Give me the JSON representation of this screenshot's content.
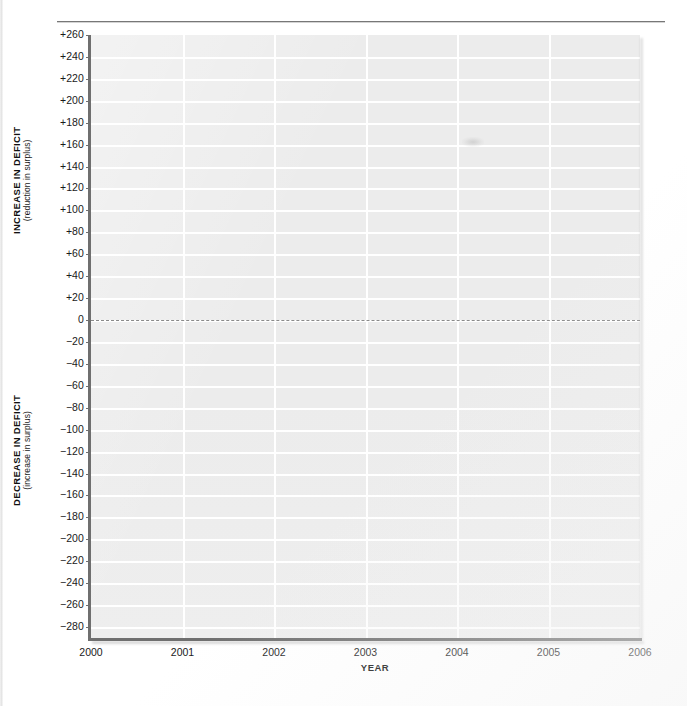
{
  "chart_data": {
    "type": "line",
    "title": "",
    "xlabel": "YEAR",
    "ylabel_upper_main": "INCREASE IN DEFICIT",
    "ylabel_upper_sub": "(reduction in surplus)",
    "ylabel_lower_main": "DECREASE IN DEFICIT",
    "ylabel_lower_sub": "(increase in surplus)",
    "x": [
      2000,
      2001,
      2002,
      2003,
      2004,
      2005,
      2006
    ],
    "xtick_labels": [
      "2000",
      "2001",
      "2002",
      "2003",
      "2004",
      "2005",
      "2006"
    ],
    "xlim": [
      2000,
      2006
    ],
    "ylim": [
      -290,
      260
    ],
    "ytick_values": [
      260,
      240,
      220,
      200,
      180,
      160,
      140,
      120,
      100,
      80,
      60,
      40,
      20,
      0,
      -20,
      -40,
      -60,
      -80,
      -100,
      -120,
      -140,
      -160,
      -180,
      -200,
      -220,
      -240,
      -260,
      -280
    ],
    "ytick_labels": [
      "+260",
      "+240",
      "+220",
      "+200",
      "+180",
      "+160",
      "+140",
      "+120",
      "+100",
      "+80",
      "+60",
      "+40",
      "+20",
      "0",
      "−20",
      "−40",
      "−60",
      "−80",
      "−100",
      "−120",
      "−140",
      "−160",
      "−180",
      "−200",
      "−220",
      "−240",
      "−260",
      "−280"
    ],
    "series": [],
    "zero_reference_line": true,
    "grid": true,
    "grid_color": "#ffffff",
    "plot_background": "#ececec",
    "axis_color": "#6f6f6f",
    "legend": [],
    "annotations": [],
    "note": "Blank grid template — no data series plotted"
  },
  "axis": {
    "x_label": "YEAR",
    "y_upper_main": "INCREASE IN DEFICIT",
    "y_upper_sub": "(reduction in surplus)",
    "y_lower_main": "DECREASE IN DEFICIT",
    "y_lower_sub": "(increase in surplus)"
  },
  "colors": {
    "plot_background": "#ececec",
    "grid": "#ffffff",
    "axis": "#6f6f6f",
    "zero_line": "#8a8a8a",
    "text": "#1a1a1a",
    "page": "#ffffff"
  }
}
